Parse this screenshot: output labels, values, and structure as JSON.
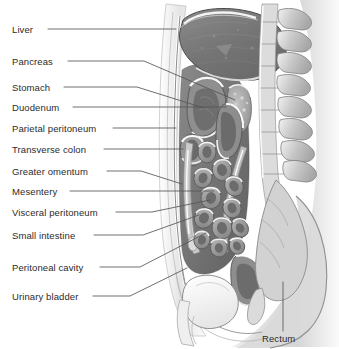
{
  "figure": {
    "background_color": "#ffffff",
    "label_color": "#2b2b2b",
    "leader_color": "#555555",
    "view": "midsagittal section, patient facing left"
  },
  "labels": [
    {
      "id": "liver",
      "text": "Liver",
      "side": "left",
      "text_x": 12,
      "text_y": 25,
      "leader": [
        [
          48,
          29
        ],
        [
          176,
          29
        ]
      ]
    },
    {
      "id": "pancreas",
      "text": "Pancreas",
      "side": "left",
      "text_x": 12,
      "text_y": 57,
      "leader": [
        [
          68,
          61
        ],
        [
          144,
          61
        ],
        [
          235,
          100
        ]
      ]
    },
    {
      "id": "stomach",
      "text": "Stomach",
      "side": "left",
      "text_x": 12,
      "text_y": 83,
      "leader": [
        [
          64,
          87
        ],
        [
          137,
          87
        ],
        [
          204,
          108
        ]
      ]
    },
    {
      "id": "duodenum",
      "text": "Duodenum",
      "side": "left",
      "text_x": 12,
      "text_y": 103,
      "leader": [
        [
          73,
          107
        ],
        [
          226,
          107
        ]
      ]
    },
    {
      "id": "parietal-peritoneum",
      "text": "Parietal peritoneum",
      "side": "left",
      "text_x": 12,
      "text_y": 124,
      "leader": [
        [
          113,
          128
        ],
        [
          176,
          128
        ]
      ]
    },
    {
      "id": "transverse-colon",
      "text": "Transverse colon",
      "side": "left",
      "text_x": 12,
      "text_y": 145,
      "leader": [
        [
          104,
          149
        ],
        [
          183,
          149
        ]
      ]
    },
    {
      "id": "greater-omentum",
      "text": "Greater omentum",
      "side": "left",
      "text_x": 12,
      "text_y": 167,
      "leader": [
        [
          107,
          171
        ],
        [
          141,
          171
        ],
        [
          182,
          184
        ]
      ]
    },
    {
      "id": "mesentery",
      "text": "Mesentery",
      "side": "left",
      "text_x": 12,
      "text_y": 187,
      "leader": [
        [
          70,
          191
        ],
        [
          214,
          191
        ]
      ]
    },
    {
      "id": "visceral-peritoneum",
      "text": "Visceral peritoneum",
      "side": "left",
      "text_x": 12,
      "text_y": 208,
      "leader": [
        [
          116,
          212
        ],
        [
          152,
          212
        ],
        [
          210,
          200
        ]
      ]
    },
    {
      "id": "small-intestine",
      "text": "Small intestine",
      "side": "left",
      "text_x": 12,
      "text_y": 231,
      "leader": [
        [
          94,
          235
        ],
        [
          143,
          235
        ],
        [
          199,
          215
        ]
      ]
    },
    {
      "id": "peritoneal-cavity",
      "text": "Peritoneal cavity",
      "side": "left",
      "text_x": 12,
      "text_y": 263,
      "leader": [
        [
          100,
          267
        ],
        [
          140,
          267
        ],
        [
          206,
          233
        ]
      ]
    },
    {
      "id": "urinary-bladder",
      "text": "Urinary bladder",
      "side": "left",
      "text_x": 12,
      "text_y": 292,
      "leader": [
        [
          93,
          296
        ],
        [
          130,
          296
        ],
        [
          187,
          268
        ]
      ]
    },
    {
      "id": "rectum",
      "text": "Rectum",
      "side": "below",
      "text_x": 262,
      "text_y": 334,
      "leader": [
        [
          283,
          331
        ],
        [
          283,
          282
        ]
      ]
    }
  ],
  "anatomy": {
    "liver": {
      "label": "Liver",
      "fill": "#787878"
    },
    "stomach": {
      "label": "Stomach",
      "fill": "#8d8d8d"
    },
    "pancreas": {
      "label": "Pancreas",
      "fill": "#9a9a9a"
    },
    "duodenum": {
      "label": "Duodenum",
      "fill": "#8a8a8a"
    },
    "transverse_colon": {
      "label": "Transverse colon",
      "fill": "#909090"
    },
    "small_intestine": {
      "label": "Small intestine",
      "fill": "#9b9b9b"
    },
    "greater_omentum": {
      "label": "Greater omentum",
      "fill": "#c9c9c9"
    },
    "mesentery": {
      "label": "Mesentery",
      "fill": "#bdbdbd"
    },
    "peritoneal_cavity": {
      "label": "Peritoneal cavity",
      "fill": "#6f6f6f"
    },
    "rectum": {
      "label": "Rectum",
      "fill": "#8e8e8e"
    },
    "urinary_bladder": {
      "label": "Urinary bladder",
      "fill": "#f2f2f2"
    },
    "vertebrae": {
      "label": "Vertebral column",
      "fill": "#cfcfcf"
    },
    "body_wall": {
      "label": "Abdominal wall",
      "fill": "#ededed"
    },
    "sacrum": {
      "label": "Sacrum",
      "fill": "#d8d8d8"
    }
  }
}
